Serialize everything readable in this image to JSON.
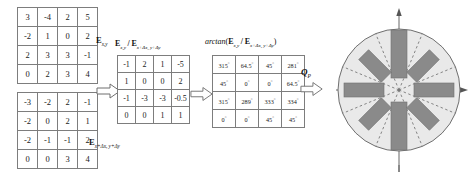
{
  "figure": {
    "matrix_exy": {
      "label_parts": {
        "base": "E",
        "sub": "x,y"
      },
      "rows": [
        [
          "3",
          "-4",
          "2",
          "5"
        ],
        [
          "-2",
          "1",
          "0",
          "2"
        ],
        [
          "2",
          "3",
          "3",
          "-1"
        ],
        [
          "0",
          "2",
          "3",
          "4"
        ]
      ]
    },
    "matrix_exdx": {
      "label_parts": {
        "base": "E",
        "sub": "x+Δx, y+Δy"
      },
      "rows": [
        [
          "-3",
          "-2",
          "2",
          "-1"
        ],
        [
          "-2",
          "0",
          "2",
          "1"
        ],
        [
          "-2",
          "-1",
          "-1",
          "2"
        ],
        [
          "0",
          "0",
          "3",
          "4"
        ]
      ]
    },
    "matrix_ratio": {
      "label_parts": {
        "numerator_base": "E",
        "numerator_sub": "x,y",
        "denominator_base": "E",
        "denominator_sub": "x+Δx, y+Δy"
      },
      "rows": [
        [
          "-1",
          "2",
          "1",
          "-5"
        ],
        [
          "1",
          "0",
          "0",
          "2"
        ],
        [
          "-1",
          "-3",
          "-3",
          "-0.5"
        ],
        [
          "0",
          "0",
          "1",
          "1"
        ]
      ]
    },
    "matrix_arctan": {
      "label_parts": {
        "fn": "arctan",
        "numerator_base": "E",
        "numerator_sub": "x,y",
        "denominator_base": "E",
        "denominator_sub": "x+Δx, y+Δy"
      },
      "degree_symbol": "°",
      "rows": [
        [
          "315",
          "64.5",
          "45",
          "281"
        ],
        [
          "45",
          "0",
          "0",
          "64.5"
        ],
        [
          "315",
          "289",
          "333",
          "334"
        ],
        [
          "0",
          "0",
          "45",
          "45"
        ]
      ]
    },
    "output_label": {
      "base": "Q",
      "sub": "P"
    },
    "arrows": [
      "arrow-1",
      "arrow-2",
      "arrow-3"
    ],
    "rose_diagram": {
      "name": "orientation-histogram-rose",
      "sectors": 8,
      "sector_divider_style": "dashed",
      "disk_fill": "#e9e9e9",
      "bar_fill": "#8a8a8a",
      "axis_x_label": "",
      "axis_y_label": "",
      "bins": [
        {
          "angle_deg": 0,
          "magnitude": 0.8
        },
        {
          "angle_deg": 45,
          "magnitude": 0.62
        },
        {
          "angle_deg": 90,
          "magnitude": 0.92
        },
        {
          "angle_deg": 135,
          "magnitude": 0.68
        },
        {
          "angle_deg": 180,
          "magnitude": 0.8
        },
        {
          "angle_deg": 225,
          "magnitude": 0.62
        },
        {
          "angle_deg": 270,
          "magnitude": 0.92
        },
        {
          "angle_deg": 315,
          "magnitude": 0.68
        }
      ]
    },
    "colors": {
      "grid_line": "#7d7d7d",
      "text": "#1a1a1a",
      "disk": "#e9e9e9",
      "bar": "#8a8a8a",
      "axis": "#555555"
    }
  }
}
